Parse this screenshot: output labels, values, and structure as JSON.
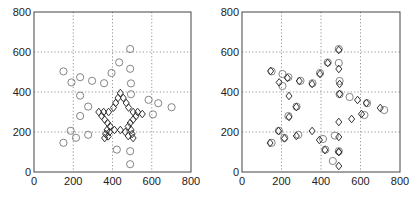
{
  "chart_data": [
    {
      "type": "scatter",
      "title": "",
      "xlabel": "",
      "ylabel": "",
      "xlim": [
        0,
        800
      ],
      "ylim": [
        0,
        800
      ],
      "xticks": [
        0,
        200,
        400,
        600,
        800
      ],
      "yticks": [
        0,
        200,
        400,
        600,
        800
      ],
      "grid": true,
      "legend": null,
      "series": [
        {
          "name": "circles",
          "marker": "circle",
          "color": "#777777",
          "points": [
            [
              490,
              615
            ],
            [
              434,
              548
            ],
            [
              490,
              516
            ],
            [
              395,
              495
            ],
            [
              150,
              503
            ],
            [
              235,
              474
            ],
            [
              191,
              448
            ],
            [
              296,
              456
            ],
            [
              357,
              444
            ],
            [
              494,
              443
            ],
            [
              235,
              382
            ],
            [
              494,
              389
            ],
            [
              584,
              361
            ],
            [
              633,
              344
            ],
            [
              701,
              324
            ],
            [
              276,
              327
            ],
            [
              235,
              280
            ],
            [
              606,
              288
            ],
            [
              187,
              206
            ],
            [
              214,
              171
            ],
            [
              276,
              186
            ],
            [
              150,
              146
            ],
            [
              422,
              112
            ],
            [
              490,
              104
            ],
            [
              490,
              39
            ]
          ]
        },
        {
          "name": "diamonds",
          "marker": "diamond",
          "color": "#333333",
          "points": [
            [
              440,
              395
            ],
            [
              428,
              370
            ],
            [
              416,
              345
            ],
            [
              405,
              322
            ],
            [
              455,
              370
            ],
            [
              470,
              345
            ],
            [
              482,
              322
            ],
            [
              330,
              300
            ],
            [
              355,
              300
            ],
            [
              380,
              300
            ],
            [
              505,
              300
            ],
            [
              528,
              300
            ],
            [
              552,
              290
            ],
            [
              345,
              280
            ],
            [
              360,
              262
            ],
            [
              375,
              245
            ],
            [
              388,
              228
            ],
            [
              520,
              280
            ],
            [
              505,
              262
            ],
            [
              490,
              245
            ],
            [
              480,
              228
            ],
            [
              372,
              210
            ],
            [
              365,
              190
            ],
            [
              360,
              170
            ],
            [
              495,
              210
            ],
            [
              500,
              190
            ],
            [
              505,
              170
            ],
            [
              385,
              200
            ],
            [
              410,
              210
            ],
            [
              440,
              210
            ],
            [
              465,
              200
            ],
            [
              378,
              178
            ],
            [
              480,
              180
            ]
          ]
        }
      ]
    },
    {
      "type": "scatter",
      "title": "",
      "xlabel": "",
      "ylabel": "",
      "xlim": [
        0,
        800
      ],
      "ylim": [
        0,
        800
      ],
      "xticks": [
        0,
        200,
        400,
        600,
        800
      ],
      "yticks": [
        0,
        200,
        400,
        600,
        800
      ],
      "grid": true,
      "legend": null,
      "series": [
        {
          "name": "circles",
          "marker": "circle",
          "color": "#777777",
          "points": [
            [
              490,
              615
            ],
            [
              434,
              548
            ],
            [
              490,
              545
            ],
            [
              395,
              495
            ],
            [
              150,
              503
            ],
            [
              235,
              474
            ],
            [
              205,
              490
            ],
            [
              296,
              456
            ],
            [
              357,
              444
            ],
            [
              494,
              455
            ],
            [
              205,
              430
            ],
            [
              494,
              389
            ],
            [
              545,
              375
            ],
            [
              633,
              344
            ],
            [
              720,
              310
            ],
            [
              276,
              327
            ],
            [
              235,
              280
            ],
            [
              620,
              285
            ],
            [
              187,
              206
            ],
            [
              214,
              171
            ],
            [
              285,
              186
            ],
            [
              150,
              146
            ],
            [
              422,
              112
            ],
            [
              490,
              104
            ],
            [
              460,
              55
            ],
            [
              470,
              182
            ],
            [
              410,
              165
            ]
          ]
        },
        {
          "name": "diamonds",
          "marker": "diamond",
          "color": "#333333",
          "points": [
            [
              490,
              610
            ],
            [
              434,
              545
            ],
            [
              490,
              515
            ],
            [
              395,
              490
            ],
            [
              145,
              505
            ],
            [
              230,
              470
            ],
            [
              188,
              448
            ],
            [
              290,
              455
            ],
            [
              355,
              440
            ],
            [
              494,
              440
            ],
            [
              238,
              380
            ],
            [
              494,
              390
            ],
            [
              585,
              360
            ],
            [
              630,
              345
            ],
            [
              700,
              320
            ],
            [
              275,
              325
            ],
            [
              238,
              275
            ],
            [
              605,
              290
            ],
            [
              185,
              205
            ],
            [
              215,
              168
            ],
            [
              275,
              180
            ],
            [
              142,
              145
            ],
            [
              420,
              110
            ],
            [
              490,
              100
            ],
            [
              490,
              30
            ],
            [
              490,
              250
            ],
            [
              555,
              265
            ],
            [
              355,
              205
            ],
            [
              392,
              160
            ],
            [
              490,
              175
            ],
            [
              490,
              100
            ]
          ]
        }
      ]
    }
  ],
  "axes": {
    "x_tick_labels": [
      "0",
      "200",
      "400",
      "600",
      "800"
    ],
    "y_tick_labels": [
      "0",
      "200",
      "400",
      "600",
      "800"
    ]
  }
}
